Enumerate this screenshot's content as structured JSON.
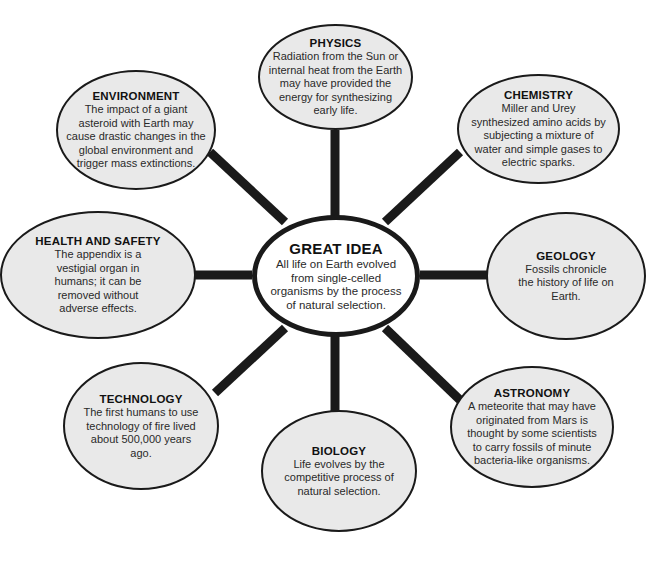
{
  "diagram": {
    "type": "concept-web",
    "center": {
      "title": "GREAT IDEA",
      "text": "All life on Earth evolved from single-celled organisms by the process of natural selection."
    },
    "nodes": [
      {
        "id": "physics",
        "title": "PHYSICS",
        "text": "Radiation from the Sun or internal heat from the Earth may have provided the energy for synthesizing early life."
      },
      {
        "id": "chemistry",
        "title": "CHEMISTRY",
        "text": "Miller and Urey synthesized amino acids by subjecting a mixture of water and simple gases to electric sparks."
      },
      {
        "id": "geology",
        "title": "GEOLOGY",
        "text": "Fossils chronicle the history of life on Earth."
      },
      {
        "id": "astronomy",
        "title": "ASTRONOMY",
        "text": "A meteorite that may have originated from Mars is thought by some scientists to carry fossils of minute bacteria-like organisms."
      },
      {
        "id": "biology",
        "title": "BIOLOGY",
        "text": "Life evolves by the competitive process of natural selection."
      },
      {
        "id": "technology",
        "title": "TECHNOLOGY",
        "text": "The first humans to use technology of fire lived about 500,000 years ago."
      },
      {
        "id": "health-and-safety",
        "title": "HEALTH AND SAFETY",
        "text": "The appendix is a vestigial organ in humans; it can be removed without adverse effects."
      },
      {
        "id": "environment",
        "title": "ENVIRONMENT",
        "text": "The impact of a giant asteroid with Earth may cause drastic changes in the global environment and trigger mass extinctions."
      }
    ],
    "colors": {
      "outer_fill": "#e9e9e9",
      "center_fill": "#ffffff",
      "stroke": "#1a1a1a"
    }
  }
}
